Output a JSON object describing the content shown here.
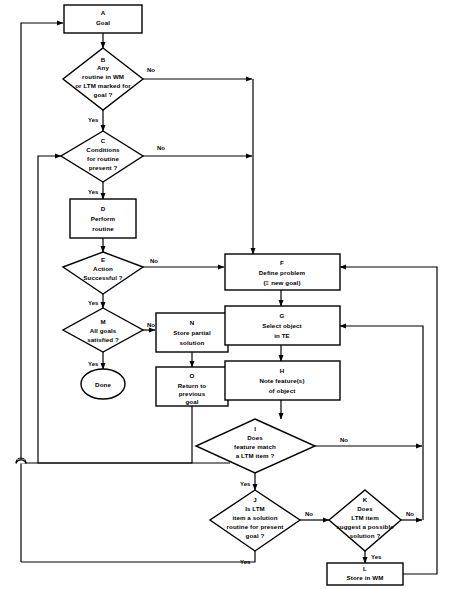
{
  "diagram": {
    "nodes": {
      "A": {
        "id": "A",
        "lines": [
          "Goal"
        ],
        "shape": "process"
      },
      "B": {
        "id": "B",
        "lines": [
          "Any",
          "routine in WM",
          "or LTM marked for",
          "goal ?"
        ],
        "shape": "decision"
      },
      "C": {
        "id": "C",
        "lines": [
          "Conditions",
          "for   routine",
          "present ?"
        ],
        "shape": "decision"
      },
      "D": {
        "id": "D",
        "lines": [
          "Perform",
          "routine"
        ],
        "shape": "process"
      },
      "E": {
        "id": "E",
        "lines": [
          "Action",
          "Successful ?"
        ],
        "shape": "decision"
      },
      "F": {
        "id": "F",
        "lines": [
          "Define problem",
          "(≡ new goal)"
        ],
        "shape": "process"
      },
      "G": {
        "id": "G",
        "lines": [
          "Select object",
          "in TE"
        ],
        "shape": "process"
      },
      "H": {
        "id": "H",
        "lines": [
          "Note feature(s)",
          "of object"
        ],
        "shape": "process"
      },
      "I": {
        "id": "I",
        "lines": [
          "Does",
          "feature match",
          "a LTM item ?"
        ],
        "shape": "decision"
      },
      "J": {
        "id": "J",
        "lines": [
          "Is LTM",
          "item a solution",
          "routine for present",
          "goal ?"
        ],
        "shape": "decision"
      },
      "K": {
        "id": "K",
        "lines": [
          "Does",
          "LTM item",
          "suggest a possible",
          "solution ?"
        ],
        "shape": "decision"
      },
      "L": {
        "id": "L",
        "lines": [
          "Store in WM"
        ],
        "shape": "process"
      },
      "M": {
        "id": "M",
        "lines": [
          "All goals",
          "satisfied ?"
        ],
        "shape": "decision"
      },
      "N": {
        "id": "N",
        "lines": [
          "Store partial",
          "solution"
        ],
        "shape": "process"
      },
      "O": {
        "id": "O",
        "lines": [
          "Return to",
          "previous",
          "goal"
        ],
        "shape": "process"
      },
      "Done": {
        "id": "",
        "lines": [
          "Done"
        ],
        "shape": "terminal"
      }
    },
    "edge_labels": {
      "b_no": "No",
      "b_yes": "Yes",
      "c_no": "No",
      "c_yes": "Yes",
      "e_no": "No",
      "e_yes": "Yes",
      "m_no": "No",
      "m_yes": "Yes",
      "i_no": "No",
      "i_yes": "Yes",
      "j_no": "No",
      "j_yes": "Yes",
      "k_no": "No",
      "k_yes": "Yes"
    },
    "colors": {
      "stroke": "#000000",
      "fill": "#ffffff",
      "text": "#000000"
    }
  }
}
